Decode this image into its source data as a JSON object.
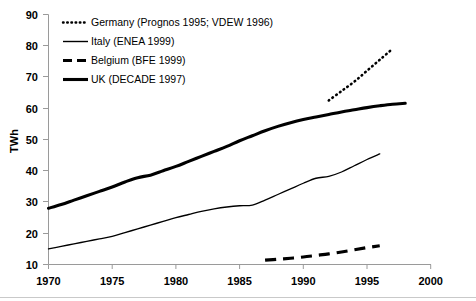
{
  "chart_data": {
    "type": "line",
    "title": "",
    "xlabel": "",
    "ylabel": "TWh",
    "xlim": [
      1970,
      2000
    ],
    "ylim": [
      10,
      90
    ],
    "xticks": [
      1970,
      1975,
      1980,
      1985,
      1990,
      1995,
      2000
    ],
    "yticks": [
      10,
      20,
      30,
      40,
      50,
      60,
      70,
      80,
      90
    ],
    "grid": false,
    "legend_position": "upper-left-inside",
    "series": [
      {
        "name": "Germany (Prognos 1995; VDEW 1996)",
        "style": "dotted",
        "linewidth": "medium",
        "x": [
          1992,
          1993,
          1994,
          1995,
          1996,
          1997
        ],
        "values": [
          62.5,
          65.5,
          68.5,
          72.0,
          75.5,
          79.0
        ]
      },
      {
        "name": "Italy (ENEA 1999)",
        "style": "solid",
        "linewidth": "thin",
        "x": [
          1970,
          1971,
          1972,
          1973,
          1974,
          1975,
          1976,
          1977,
          1978,
          1979,
          1980,
          1981,
          1982,
          1983,
          1984,
          1985,
          1986,
          1987,
          1988,
          1989,
          1990,
          1991,
          1992,
          1993,
          1994,
          1995,
          1996
        ],
        "values": [
          15.0,
          15.8,
          16.6,
          17.4,
          18.2,
          19.0,
          20.2,
          21.4,
          22.6,
          23.8,
          25.0,
          26.0,
          27.0,
          27.8,
          28.4,
          28.8,
          29.0,
          30.6,
          32.4,
          34.2,
          36.0,
          37.6,
          38.2,
          39.6,
          41.6,
          43.6,
          45.4
        ]
      },
      {
        "name": "Belgium (BFE 1999)",
        "style": "dashed",
        "linewidth": "thick",
        "x": [
          1987,
          1988,
          1989,
          1990,
          1991,
          1992,
          1993,
          1994,
          1995,
          1996
        ],
        "values": [
          11.4,
          11.7,
          12.0,
          12.4,
          12.9,
          13.4,
          14.0,
          14.7,
          15.4,
          16.0
        ]
      },
      {
        "name": "UK (DECADE 1997)",
        "style": "solid",
        "linewidth": "thick",
        "x": [
          1970,
          1971,
          1972,
          1973,
          1974,
          1975,
          1976,
          1977,
          1978,
          1979,
          1980,
          1981,
          1982,
          1983,
          1984,
          1985,
          1986,
          1987,
          1988,
          1989,
          1990,
          1991,
          1992,
          1993,
          1994,
          1995,
          1996,
          1997,
          1998
        ],
        "values": [
          28.0,
          29.2,
          30.6,
          32.0,
          33.4,
          34.8,
          36.4,
          37.8,
          38.6,
          40.0,
          41.4,
          43.0,
          44.6,
          46.2,
          47.8,
          49.6,
          51.2,
          52.8,
          54.2,
          55.4,
          56.4,
          57.2,
          58.0,
          58.8,
          59.5,
          60.2,
          60.8,
          61.3,
          61.6
        ]
      }
    ]
  },
  "axes": {
    "ylabel": "TWh",
    "ytick_labels": [
      "90",
      "80",
      "70",
      "60",
      "50",
      "40",
      "30",
      "20",
      "10"
    ],
    "xtick_labels": [
      "1970",
      "1975",
      "1980",
      "1985",
      "1990",
      "1995",
      "2000"
    ]
  },
  "legend": {
    "entries": [
      {
        "label": "Germany (Prognos 1995; VDEW 1996)",
        "marker": "dotted-line-icon"
      },
      {
        "label": "Italy (ENEA 1999)",
        "marker": "thin-solid-line-icon"
      },
      {
        "label": "Belgium (BFE 1999)",
        "marker": "dashed-line-icon"
      },
      {
        "label": "UK (DECADE 1997)",
        "marker": "thick-solid-line-icon"
      }
    ]
  },
  "colors": {
    "series": "#000000",
    "axis": "#9a9a9a",
    "background": "#ffffff"
  }
}
